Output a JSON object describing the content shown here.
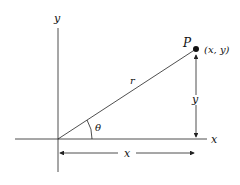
{
  "diagram": {
    "labels": {
      "y_axis": "y",
      "x_axis": "x",
      "point_name": "P",
      "point_coords": "(x, y)",
      "radius": "r",
      "angle": "θ",
      "vertical_dim": "y",
      "horizontal_dim": "x"
    },
    "colors": {
      "line": "#222222",
      "background": "#ffffff"
    }
  }
}
